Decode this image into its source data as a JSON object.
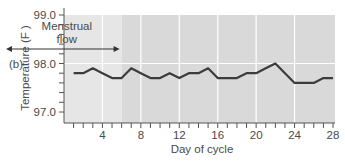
{
  "chart_data": {
    "type": "line",
    "panel_label": "(b)",
    "title": "",
    "xlabel": "Day of cycle",
    "ylabel": "Temperature (F )",
    "xlim": [
      0,
      28
    ],
    "ylim": [
      97.0,
      99.0
    ],
    "x_ticks": [
      4,
      8,
      12,
      16,
      20,
      24,
      28
    ],
    "y_ticks": [
      "97.0",
      "98.0",
      "99.0"
    ],
    "grid": true,
    "annotation": {
      "text_line1": "Menstrual",
      "text_line2": "flow",
      "from_day": 0,
      "to_day": 6
    },
    "series": [
      {
        "name": "Basal body temperature",
        "color": "#3c3c3c",
        "x": [
          1,
          2,
          3,
          4,
          5,
          6,
          7,
          8,
          9,
          10,
          11,
          12,
          13,
          14,
          15,
          16,
          17,
          18,
          19,
          20,
          21,
          22,
          23,
          24,
          25,
          26,
          27,
          28
        ],
        "values": [
          97.8,
          97.8,
          97.9,
          97.8,
          97.7,
          97.7,
          97.9,
          97.8,
          97.7,
          97.7,
          97.8,
          97.7,
          97.8,
          97.8,
          97.9,
          97.7,
          97.7,
          97.7,
          97.8,
          97.8,
          97.9,
          98.0,
          97.8,
          97.6,
          97.6,
          97.6,
          97.7,
          97.7
        ]
      }
    ],
    "colors": {
      "menstrual_region": "#e6e6e6",
      "rest_region": "#d9d9d9",
      "gridline": "#ffffff",
      "axis": "#555555"
    }
  }
}
